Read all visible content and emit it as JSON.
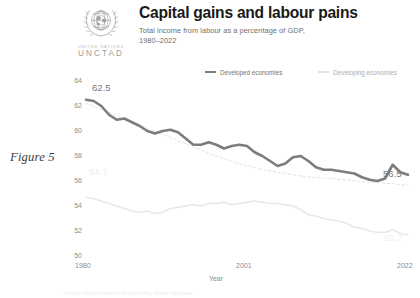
{
  "header": {
    "title": "Capital gains and labour pains",
    "subtitle": "Total income from labour as a percentage of GDP,\n1980–2022",
    "logo": {
      "organization": "UNITED NATIONS",
      "acronym": "UNCTAD",
      "emblem_name": "un-emblem"
    }
  },
  "figure": {
    "caption": "Figure 5"
  },
  "legend": {
    "position": "top-right",
    "items": [
      {
        "label": "Developed economies",
        "color": "#7d7d7d",
        "style": "solid"
      },
      {
        "label": "Developing economies",
        "color": "#e4e4e4",
        "style": "solid"
      }
    ]
  },
  "source": {
    "note": "Source: United Nations Global Policy Model database"
  },
  "chart_data": {
    "type": "line",
    "title": "Capital gains and labour pains",
    "subtitle": "Total income from labour as a percentage of GDP, 1980–2022",
    "xlabel": "Year",
    "ylabel": "",
    "xlim": [
      1980,
      2022
    ],
    "ylim": [
      50,
      64
    ],
    "grid": false,
    "x_ticks": [
      "1980",
      "2001",
      "2022"
    ],
    "x_tick_values": [
      1980,
      2001,
      2022
    ],
    "y_ticks": [
      "50",
      "52",
      "54",
      "56",
      "58",
      "60",
      "62",
      "64"
    ],
    "y_tick_values": [
      50,
      52,
      54,
      56,
      58,
      60,
      62,
      64
    ],
    "annotations": [
      {
        "text": "62.5",
        "series": "Developed economies",
        "x": 1980,
        "y": 62.5,
        "placement": "above-start"
      },
      {
        "text": "56.5",
        "series": "Developed economies",
        "x": 2022,
        "y": 56.5,
        "placement": "above-end"
      },
      {
        "text": "54.7",
        "series": "Developing economies",
        "x": 1980,
        "y": 54.7,
        "placement": "above-start"
      },
      {
        "text": "51.7",
        "series": "Developing economies",
        "x": 2022,
        "y": 51.7,
        "placement": "above-end"
      }
    ],
    "x": [
      1980,
      1981,
      1982,
      1983,
      1984,
      1985,
      1986,
      1987,
      1988,
      1989,
      1990,
      1991,
      1992,
      1993,
      1994,
      1995,
      1996,
      1997,
      1998,
      1999,
      2000,
      2001,
      2002,
      2003,
      2004,
      2005,
      2006,
      2007,
      2008,
      2009,
      2010,
      2011,
      2012,
      2013,
      2014,
      2015,
      2016,
      2017,
      2018,
      2019,
      2020,
      2021,
      2022
    ],
    "series": [
      {
        "name": "Developed economies",
        "color": "#7d7d7d",
        "values": [
          62.5,
          62.4,
          62.0,
          61.3,
          60.9,
          61.0,
          60.7,
          60.4,
          60.0,
          59.8,
          60.0,
          60.1,
          59.9,
          59.4,
          58.9,
          58.9,
          59.1,
          58.9,
          58.6,
          58.8,
          58.9,
          58.8,
          58.3,
          58.0,
          57.6,
          57.2,
          57.4,
          57.9,
          58.0,
          57.6,
          57.1,
          56.9,
          56.9,
          56.8,
          56.7,
          56.6,
          56.3,
          56.1,
          56.0,
          56.2,
          57.3,
          56.7,
          56.5
        ]
      },
      {
        "name": "Developing economies",
        "color": "#e4e4e4",
        "values": [
          54.7,
          54.6,
          54.4,
          54.2,
          54.0,
          53.8,
          53.6,
          53.5,
          53.6,
          53.4,
          53.5,
          53.8,
          53.9,
          54.0,
          54.1,
          54.0,
          54.2,
          54.2,
          54.3,
          54.1,
          54.2,
          54.3,
          54.4,
          54.3,
          54.2,
          54.2,
          54.1,
          54.0,
          53.7,
          53.3,
          53.2,
          53.0,
          52.9,
          52.8,
          52.6,
          52.3,
          52.2,
          52.0,
          51.9,
          51.9,
          52.1,
          51.8,
          51.7
        ]
      },
      {
        "name": "Developed economies trend",
        "color": "#dedede",
        "style": "dotted",
        "values": [
          62.2,
          62.0,
          61.7,
          61.5,
          61.2,
          61.0,
          60.7,
          60.5,
          60.2,
          60.0,
          59.7,
          59.5,
          59.2,
          59.0,
          58.7,
          58.5,
          58.2,
          58.0,
          57.8,
          57.6,
          57.4,
          57.2,
          57.1,
          56.9,
          56.8,
          56.7,
          56.6,
          56.5,
          56.4,
          56.3,
          56.3,
          56.2,
          56.2,
          56.1,
          56.1,
          56.0,
          56.0,
          55.9,
          55.9,
          55.8,
          55.8,
          55.7,
          55.7
        ]
      }
    ]
  }
}
